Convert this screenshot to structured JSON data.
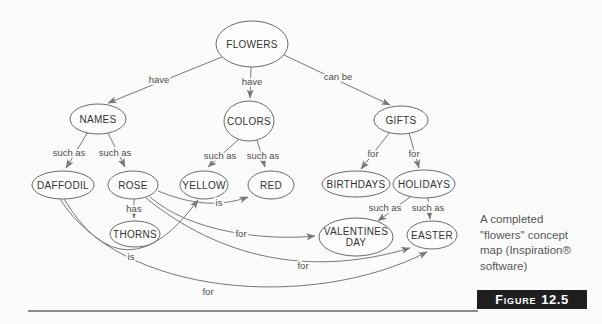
{
  "colors": {
    "background": "#fbfbfb",
    "node_fill": "#fdfdfd",
    "line": "#787878",
    "node_text": "#333333",
    "label_text": "#4d4d4d",
    "badge_bg": "#1f1f1f",
    "badge_text": "#ffffff",
    "caption_text": "#565656",
    "rule": "#8c8c8c"
  },
  "diagram": {
    "nodes": [
      {
        "id": "flowers",
        "label": "FLOWERS",
        "lines": [
          "FLOWERS"
        ],
        "cx": 252,
        "cy": 44,
        "rx": 36,
        "ry": 23
      },
      {
        "id": "names",
        "label": "NAMES",
        "lines": [
          "NAMES"
        ],
        "cx": 98,
        "cy": 119,
        "rx": 28,
        "ry": 15
      },
      {
        "id": "colors",
        "label": "COLORS",
        "lines": [
          "COLORS"
        ],
        "cx": 249,
        "cy": 121,
        "rx": 25,
        "ry": 20
      },
      {
        "id": "gifts",
        "label": "GIFTS",
        "lines": [
          "GIFTS"
        ],
        "cx": 401,
        "cy": 120,
        "rx": 27,
        "ry": 14
      },
      {
        "id": "daffodil",
        "label": "DAFFODIL",
        "lines": [
          "DAFFODIL"
        ],
        "cx": 63,
        "cy": 185,
        "rx": 31,
        "ry": 14
      },
      {
        "id": "rose",
        "label": "ROSE",
        "lines": [
          "ROSE"
        ],
        "cx": 133,
        "cy": 185,
        "rx": 25,
        "ry": 14
      },
      {
        "id": "yellow",
        "label": "YELLOW",
        "lines": [
          "YELLOW"
        ],
        "cx": 204,
        "cy": 185,
        "rx": 24,
        "ry": 14
      },
      {
        "id": "red",
        "label": "RED",
        "lines": [
          "RED"
        ],
        "cx": 271,
        "cy": 185,
        "rx": 23,
        "ry": 14
      },
      {
        "id": "birthdays",
        "label": "BIRTHDAYS",
        "lines": [
          "BIRTHDAYS"
        ],
        "cx": 356,
        "cy": 184,
        "rx": 34,
        "ry": 13
      },
      {
        "id": "holidays",
        "label": "HOLIDAYS",
        "lines": [
          "HOLIDAYS"
        ],
        "cx": 424,
        "cy": 184,
        "rx": 31,
        "ry": 14
      },
      {
        "id": "thorns",
        "label": "THORNS",
        "lines": [
          "THORNS"
        ],
        "cx": 135,
        "cy": 234,
        "rx": 25,
        "ry": 13
      },
      {
        "id": "valentines-day",
        "label": "VALENTINES DAY",
        "lines": [
          "VALENTINES",
          "DAY"
        ],
        "cx": 356,
        "cy": 237,
        "rx": 37,
        "ry": 19
      },
      {
        "id": "easter",
        "label": "EASTER",
        "lines": [
          "EASTER"
        ],
        "cx": 432,
        "cy": 235,
        "rx": 25,
        "ry": 14
      }
    ],
    "edges": [
      {
        "from": "flowers",
        "to": "names",
        "label": "have",
        "lx": 159,
        "ly": 83,
        "path": "M222,57 L108,103"
      },
      {
        "from": "flowers",
        "to": "colors",
        "label": "have",
        "lx": 252,
        "ly": 85,
        "path": "M251,67 L250,98"
      },
      {
        "from": "flowers",
        "to": "gifts",
        "label": "can be",
        "lx": 338,
        "ly": 80,
        "path": "M284,55 L390,105"
      },
      {
        "from": "names",
        "to": "daffodil",
        "label": "such as",
        "lx": 69,
        "ly": 156,
        "path": "M88,132 L66,168"
      },
      {
        "from": "names",
        "to": "rose",
        "label": "such as",
        "lx": 115,
        "ly": 156,
        "path": "M108,133 L125,167"
      },
      {
        "from": "colors",
        "to": "yellow",
        "label": "such as",
        "lx": 220,
        "ly": 159,
        "path": "M239,139 L208,167"
      },
      {
        "from": "colors",
        "to": "red",
        "label": "such as",
        "lx": 263,
        "ly": 159,
        "path": "M257,140 L265,167"
      },
      {
        "from": "gifts",
        "to": "birthdays",
        "label": "for",
        "lx": 373,
        "ly": 157,
        "path": "M390,132 L361,169"
      },
      {
        "from": "gifts",
        "to": "holidays",
        "label": "for",
        "lx": 414,
        "ly": 157,
        "path": "M409,133 L419,168"
      },
      {
        "from": "rose",
        "to": "thorns",
        "label": "has",
        "lx": 134,
        "ly": 212,
        "path": "M134,199 L134,218"
      },
      {
        "from": "holidays",
        "to": "valentines-day",
        "label": "such as",
        "lx": 385,
        "ly": 211,
        "path": "M410,197 L378,221"
      },
      {
        "from": "holidays",
        "to": "easter",
        "label": "such as",
        "lx": 428,
        "ly": 211,
        "path": "M428,198 L430,219"
      },
      {
        "from": "rose",
        "to": "red",
        "label": "is",
        "lx": 219,
        "ly": 206,
        "path": "M158,191 Q208,212 248,197"
      },
      {
        "from": "daffodil",
        "to": "yellow",
        "label": "is",
        "lx": 131,
        "ly": 260,
        "path": "M64,199 Q125,300 198,200"
      },
      {
        "from": "rose",
        "to": "valentines-day",
        "label": "for",
        "lx": 241,
        "ly": 237,
        "path": "M150,197 C190,232 265,241 315,236"
      },
      {
        "from": "rose",
        "to": "easter",
        "label": "for",
        "lx": 303,
        "ly": 269,
        "path": "M146,198 C220,258 310,278 410,248"
      },
      {
        "from": "daffodil",
        "to": "easter",
        "label": "for",
        "lx": 208,
        "ly": 295,
        "path": "M60,199 C120,295 310,312 427,252"
      }
    ]
  },
  "caption": {
    "text": "A completed\n\"flowers\" concept\nmap (Inspiration®\nsoftware)"
  },
  "figure": {
    "word": "Figure",
    "number": "12.5"
  }
}
